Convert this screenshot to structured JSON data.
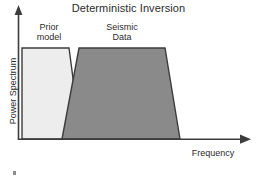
{
  "figure": {
    "title": "Deterministic Inversion",
    "background_color": "#ffffff",
    "axis_color": "#3c3c3c",
    "text_color": "#2b2b2b"
  },
  "axes": {
    "y_axis_label": "Power Spectrum",
    "x_axis_label": "Frequency",
    "y_arrow_icon": "arrow-up-icon",
    "x_arrow_icon": "arrow-right-icon",
    "ticks_shown": "none"
  },
  "series_labels": {
    "prior_model": "Prior\nmodel",
    "seismic_data": "Seismic\nData"
  },
  "chart_data": {
    "type": "area",
    "title": "Deterministic Inversion",
    "xlabel": "Frequency",
    "ylabel": "Power Spectrum",
    "xlim": [
      0,
      1
    ],
    "ylim": [
      0,
      1
    ],
    "grid": false,
    "legend": "inline-labels",
    "axis_ticks": false,
    "series": [
      {
        "name": "Prior model",
        "label": "Prior\nmodel",
        "fill_color": "#ededed",
        "edge_color": "#3c3c3c",
        "shape": "trapezoid",
        "description": "Low-frequency band: flat plateau from zero frequency, then tapering down to zero at mid-low frequency",
        "x": [
          0.02,
          0.02,
          0.245,
          0.305
        ],
        "y": [
          0.0,
          0.695,
          0.695,
          0.0
        ],
        "vertices_px": [
          [
            22,
            139
          ],
          [
            22,
            48
          ],
          [
            69,
            48
          ],
          [
            81,
            139
          ]
        ]
      },
      {
        "name": "Seismic Data",
        "label": "Seismic\nData",
        "fill_color": "#8a8a8a",
        "edge_color": "#3c3c3c",
        "shape": "trapezoid",
        "description": "Mid-band seismic bandwidth: ramps up from low frequency, flat plateau, then ramps down at high frequency",
        "x": [
          0.19,
          0.265,
          0.635,
          0.7
        ],
        "y": [
          0.0,
          0.695,
          0.695,
          0.0
        ],
        "vertices_px": [
          [
            62,
            139
          ],
          [
            79,
            48
          ],
          [
            165,
            48
          ],
          [
            180,
            139
          ]
        ]
      }
    ]
  }
}
